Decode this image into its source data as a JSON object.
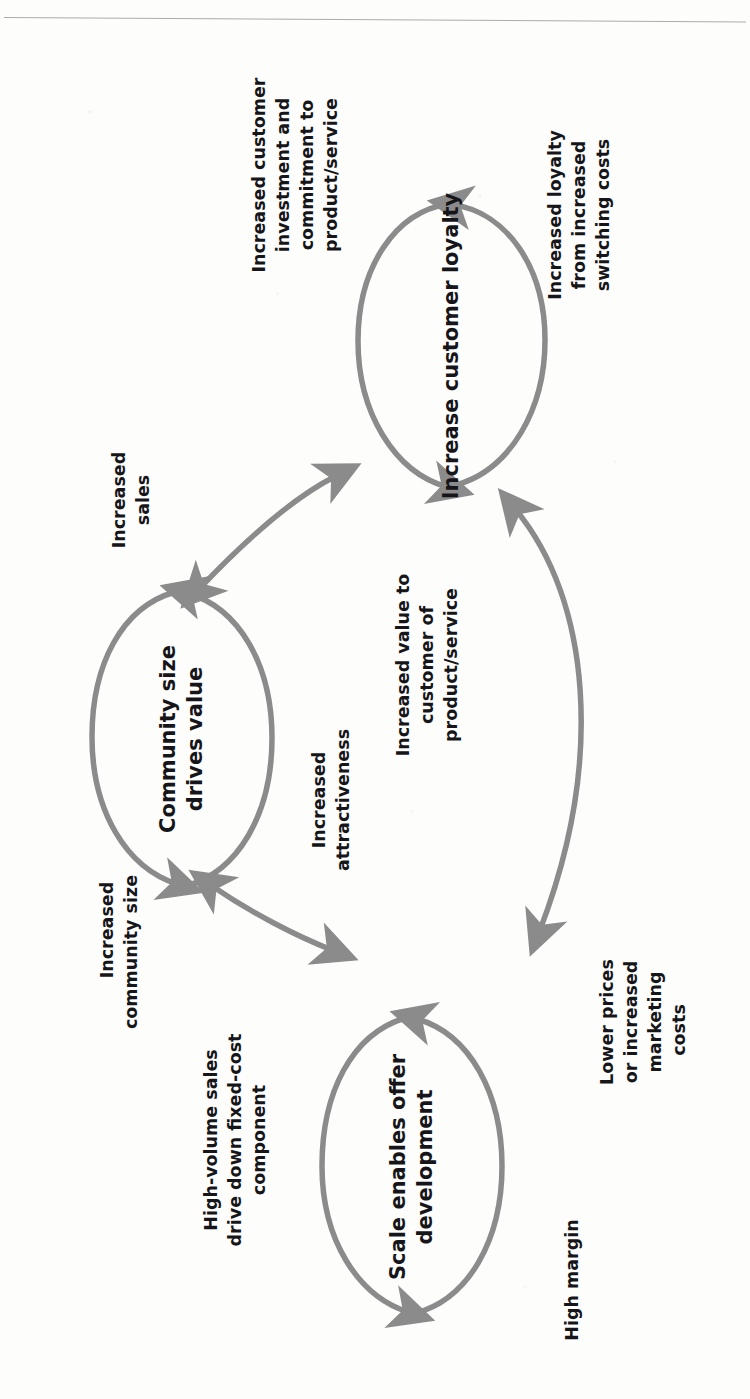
{
  "page": {
    "orientation": "rotated-90-ccw",
    "rule_visible": true
  },
  "theme": {
    "loop_stroke": "#8b8b8b",
    "arrow_fill": "#8b8b8b",
    "text_color": "#16161a",
    "page_background": "#fdfdfc",
    "rule_color": "#9c9c9c"
  },
  "diagram": {
    "type": "causal-loop",
    "nodes": [
      {
        "id": "loyalty",
        "label_lines": [
          "Increase customer loyalty"
        ]
      },
      {
        "id": "community",
        "label_lines": [
          "Community size",
          "drives value"
        ]
      },
      {
        "id": "scale",
        "label_lines": [
          "Scale enables offer",
          "development"
        ]
      }
    ],
    "loop_labels": [
      {
        "id": "loyalty-in",
        "lines": [
          "Increased customer",
          "investment and",
          "commitment to",
          "product/service"
        ]
      },
      {
        "id": "loyalty-out",
        "lines": [
          "Increased loyalty",
          "from increased",
          "switching costs"
        ]
      },
      {
        "id": "community-in",
        "lines": [
          "Increased",
          "community size"
        ]
      },
      {
        "id": "community-out",
        "lines": [
          "Increased",
          "attractiveness"
        ]
      },
      {
        "id": "scale-in",
        "lines": [
          "High-volume sales",
          "drive down fixed-cost",
          "component"
        ]
      },
      {
        "id": "scale-out",
        "lines": [
          "Lower prices",
          "or increased",
          "marketing",
          "costs"
        ]
      },
      {
        "id": "scale-margin",
        "lines": [
          "High margin"
        ]
      }
    ],
    "connector_labels": [
      {
        "id": "sales",
        "lines": [
          "Increased",
          "sales"
        ],
        "between": [
          "community",
          "loyalty"
        ]
      },
      {
        "id": "value",
        "lines": [
          "Increased value to",
          "customer of",
          "product/service"
        ],
        "between": [
          "scale",
          "loyalty"
        ]
      }
    ]
  }
}
